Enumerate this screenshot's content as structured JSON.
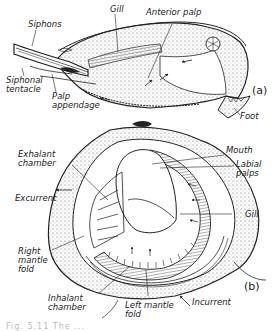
{
  "figure": {
    "panel_a": {
      "tag": "(a)",
      "labels": {
        "siphons": "Siphons",
        "gill": "Gill",
        "anterior_palp": "Anterior palp",
        "siphonal_tentacle": "Siphonal\ntentacle",
        "palp_appendage": "Palp\nappendage",
        "foot": "Foot"
      }
    },
    "panel_b": {
      "tag": "(b)",
      "labels": {
        "exhalant_chamber": "Exhalant\nchamber",
        "excurrent": "Excurrent",
        "mouth": "Mouth",
        "labial_palps": "Labial\npalps",
        "gill": "Gill",
        "right_mantle_fold": "Right\nmantle\nfold",
        "inhalant_chamber": "Inhalant\nchamber",
        "left_mantle_fold": "Left mantle\nfold",
        "incurrent": "Incurrent"
      }
    },
    "caption": "Fig. 5.11  The ..."
  }
}
